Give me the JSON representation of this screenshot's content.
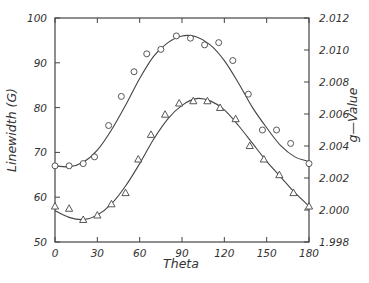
{
  "chart_data": {
    "type": "scatter",
    "title": "",
    "xlabel": "Theta",
    "ylabel": "Linewidth (G)",
    "y2label": "g—Value",
    "xlim": [
      0,
      180
    ],
    "ylim": [
      50,
      100
    ],
    "y2lim": [
      1.998,
      2.012
    ],
    "grid": false,
    "legend": "none",
    "x_ticks": [
      0,
      30,
      60,
      90,
      120,
      150,
      180
    ],
    "x_tick_labels": [
      "0",
      "30",
      "60",
      "90",
      "120",
      "150",
      "180"
    ],
    "y_ticks": [
      50,
      60,
      70,
      80,
      90,
      100
    ],
    "y_tick_labels": [
      "50",
      "60",
      "70",
      "80",
      "90",
      "100"
    ],
    "y2_ticks": [
      1.998,
      2.0,
      2.002,
      2.004,
      2.006,
      2.008,
      2.01,
      2.012
    ],
    "y2_tick_labels": [
      "1.998",
      "2.000",
      "2.002",
      "2.004",
      "2.006",
      "2.008",
      "2.010",
      "2.012"
    ],
    "series": [
      {
        "name": "Linewidth (circles)",
        "marker": "circle",
        "axis": "left",
        "x": [
          0,
          10,
          20,
          28,
          38,
          47,
          56,
          65,
          75,
          86,
          96,
          106,
          116,
          126,
          137,
          147,
          157,
          167,
          180
        ],
        "values": [
          67,
          67,
          67.5,
          69,
          76,
          82.5,
          88,
          92,
          93,
          96,
          95.5,
          94,
          94.5,
          90.5,
          83,
          75,
          75,
          72,
          67.5
        ],
        "fit": {
          "x": [
            0,
            10,
            20,
            30,
            40,
            50,
            60,
            70,
            80,
            90,
            100,
            110,
            120,
            130,
            140,
            150,
            160,
            170,
            180
          ],
          "values": [
            67,
            66.8,
            67.8,
            70.5,
            75,
            80.5,
            86.5,
            91.5,
            94.5,
            96,
            95.8,
            94,
            90.5,
            85.5,
            80,
            75.5,
            71.5,
            69,
            68
          ]
        }
      },
      {
        "name": "g-Value (triangles)",
        "marker": "triangle",
        "axis": "left",
        "x": [
          0,
          10,
          20,
          30,
          40,
          50,
          59,
          68,
          78,
          88,
          98,
          108,
          117,
          128,
          138,
          148,
          159,
          169,
          180
        ],
        "values": [
          58,
          57.5,
          55,
          56,
          58.5,
          61,
          68.5,
          74,
          78.5,
          81,
          81.5,
          81.5,
          80,
          77.5,
          71.5,
          68.5,
          65,
          61,
          58
        ],
        "fit": {
          "x": [
            0,
            10,
            20,
            30,
            40,
            50,
            60,
            70,
            80,
            90,
            100,
            110,
            120,
            130,
            140,
            150,
            160,
            170,
            180
          ],
          "values": [
            57,
            55.5,
            55,
            56,
            58.5,
            62.5,
            67.5,
            73,
            77.5,
            80.5,
            82,
            81.5,
            79.5,
            76,
            72,
            68,
            64.5,
            61,
            58
          ]
        }
      }
    ]
  }
}
